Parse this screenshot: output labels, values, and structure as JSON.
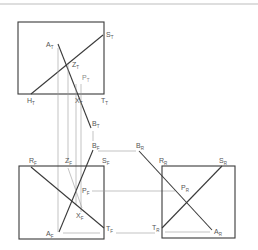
{
  "colors": {
    "frame": "#3a3a3a",
    "projection": "#9a9a9a",
    "label": "#555555",
    "rule": "#bdbdbd"
  },
  "views": {
    "top": {
      "labels": {
        "A": {
          "base": "A",
          "sub": "T"
        },
        "S": {
          "base": "S",
          "sub": "T"
        },
        "Z": {
          "base": "Z",
          "sub": "T"
        },
        "P": {
          "base": "P",
          "sub": "T"
        },
        "H": {
          "base": "H",
          "sub": "T"
        },
        "X": {
          "base": "X",
          "sub": "T"
        },
        "T": {
          "base": "T",
          "sub": "T"
        },
        "B": {
          "base": "B",
          "sub": "T"
        }
      }
    },
    "front": {
      "labels": {
        "B": {
          "base": "B",
          "sub": "F"
        },
        "R": {
          "base": "R",
          "sub": "F"
        },
        "Z": {
          "base": "Z",
          "sub": "F"
        },
        "S": {
          "base": "S",
          "sub": "F"
        },
        "P": {
          "base": "P",
          "sub": "F"
        },
        "X": {
          "base": "X",
          "sub": "F"
        },
        "A": {
          "base": "A",
          "sub": "F"
        },
        "T": {
          "base": "T",
          "sub": "F"
        }
      }
    },
    "right": {
      "labels": {
        "B": {
          "base": "B",
          "sub": "R"
        },
        "R": {
          "base": "R",
          "sub": "R"
        },
        "S": {
          "base": "S",
          "sub": "R"
        },
        "P": {
          "base": "P",
          "sub": "R"
        },
        "T": {
          "base": "T",
          "sub": "R"
        },
        "A": {
          "base": "A",
          "sub": "R"
        }
      }
    }
  }
}
